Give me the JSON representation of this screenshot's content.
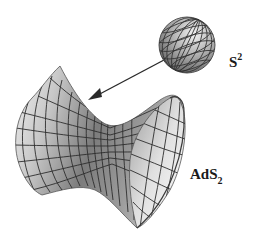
{
  "diagram": {
    "labels": {
      "sphere_base": "S",
      "sphere_sup": "2",
      "hyperboloid_base": "AdS",
      "hyperboloid_sub": "2"
    },
    "elements": [
      {
        "name": "sphere",
        "label": "S²"
      },
      {
        "name": "arrow",
        "from": "sphere",
        "to": "hyperboloid"
      },
      {
        "name": "hyperboloid",
        "label": "AdS₂"
      }
    ],
    "colors": {
      "background": "#ffffff",
      "surface_dark": "#6e6e6e",
      "surface_light": "#e8e8e8",
      "grid_line": "#2e2e2e",
      "arrow": "#2a2a2a",
      "text": "#1a1a1a"
    }
  }
}
